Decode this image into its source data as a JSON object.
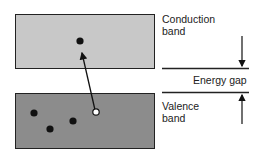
{
  "diagram": {
    "conduction_band": {
      "label_line1": "Conduction",
      "label_line2": "band",
      "fill": "#c8c8c8"
    },
    "valence_band": {
      "label_line1": "Valence",
      "label_line2": "band",
      "fill": "#8c8c8c"
    },
    "energy_gap": {
      "label": "Energy gap"
    },
    "electrons": {
      "conduction_count": 1,
      "valence_count": 3
    },
    "holes": {
      "valence_count": 1
    }
  }
}
